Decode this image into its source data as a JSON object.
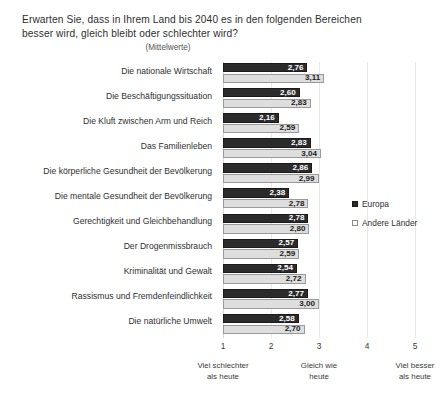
{
  "chart_data": {
    "type": "bar",
    "orientation": "horizontal",
    "title": "Erwarten Sie, dass in Ihrem Land bis 2040 es in den folgenden Bereichen besser wird, gleich bleibt oder schlechter wird?",
    "subtitle": "(Mittelwerte)",
    "xlabel": "",
    "ylabel": "",
    "xlim": [
      1,
      5
    ],
    "grid": true,
    "legend_position": "right",
    "categories": [
      "Die nationale Wirtschaft",
      "Die Beschäftigungssituation",
      "Die Kluft zwischen Arm und Reich",
      "Das Familienleben",
      "Die körperliche Gesundheit der Bevölkerung",
      "Die mentale Gesundheit der Bevölkerung",
      "Gerechtigkeit und Gleichbehandlung",
      "Der Drogenmissbrauch",
      "Kriminalität und Gewalt",
      "Rassismus und Fremdenfeindlichkeit",
      "Die natürliche Umwelt"
    ],
    "series": [
      {
        "name": "Europa",
        "color": "#2b2b2b",
        "values": [
          2.76,
          2.6,
          2.16,
          2.83,
          2.86,
          2.38,
          2.78,
          2.57,
          2.54,
          2.77,
          2.58
        ],
        "labels": [
          "2,76",
          "2,60",
          "2,16",
          "2,83",
          "2,86",
          "2,38",
          "2,78",
          "2,57",
          "2,54",
          "2,77",
          "2,58"
        ]
      },
      {
        "name": "Andere Länder",
        "color": "#dedede",
        "values": [
          3.11,
          2.83,
          2.59,
          3.04,
          2.99,
          2.78,
          2.8,
          2.59,
          2.72,
          3.0,
          2.7
        ],
        "labels": [
          "3,11",
          "2,83",
          "2,59",
          "3,04",
          "2,99",
          "2,78",
          "2,80",
          "2,59",
          "2,72",
          "3,00",
          "2,70"
        ]
      }
    ],
    "x_ticks": [
      "1",
      "2",
      "3",
      "4",
      "5"
    ],
    "x_tick_values": [
      1,
      2,
      3,
      4,
      5
    ],
    "x_axis_captions": [
      {
        "at": 1,
        "line1": "Viel schlechter",
        "line2": "als heute"
      },
      {
        "at": 3,
        "line1": "Gleich wie",
        "line2": "heute"
      },
      {
        "at": 5,
        "line1": "Viel besser",
        "line2": "als heute"
      }
    ]
  },
  "legend": {
    "items": [
      {
        "label": "Europa"
      },
      {
        "label": "Andere Länder"
      }
    ]
  }
}
